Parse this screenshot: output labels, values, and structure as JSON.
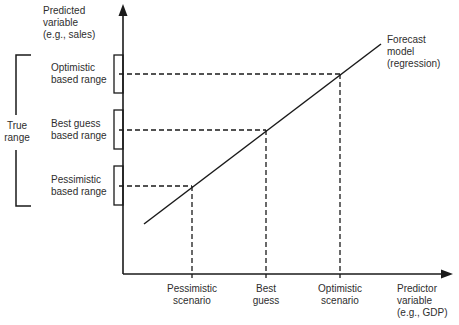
{
  "diagram": {
    "type": "forecast-scenario-diagram",
    "y_axis_label": [
      "Predicted",
      "variable",
      "(e.g., sales)"
    ],
    "x_axis_label": [
      "Predictor",
      "variable",
      "(e.g., GDP)"
    ],
    "model_label": [
      "Forecast",
      "model",
      "(regression)"
    ],
    "true_range_label": [
      "True",
      "range"
    ],
    "y_ranges": [
      {
        "name": "optimistic",
        "label": [
          "Optimistic",
          "based range"
        ],
        "y_px": 74,
        "box_top": 55,
        "box_bottom": 93
      },
      {
        "name": "best-guess",
        "label": [
          "Best guess",
          "based range"
        ],
        "y_px": 130,
        "box_top": 110,
        "box_bottom": 149
      },
      {
        "name": "pessimistic",
        "label": [
          "Pessimistic",
          "based range"
        ],
        "y_px": 186,
        "box_top": 166,
        "box_bottom": 205
      }
    ],
    "x_scenarios": [
      {
        "name": "pessimistic",
        "label": [
          "Pessimistic",
          "scenario"
        ],
        "x_px": 192,
        "y_px": 186
      },
      {
        "name": "best-guess",
        "label": [
          "Best",
          "guess"
        ],
        "x_px": 266,
        "y_px": 130
      },
      {
        "name": "optimistic",
        "label": [
          "Optimistic",
          "scenario"
        ],
        "x_px": 340,
        "y_px": 74
      }
    ],
    "model_line": {
      "x1": 144,
      "y1": 224,
      "x2": 381,
      "y2": 44
    },
    "axes": {
      "origin_x": 123,
      "origin_y": 274,
      "y_top": 4,
      "x_right": 453
    },
    "colors": {
      "line": "#1a1a1a",
      "text": "#2e2e2e",
      "background": "#ffffff"
    }
  }
}
